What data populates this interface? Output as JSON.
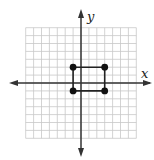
{
  "diagram": {
    "type": "coordinate-plane",
    "axes": {
      "x_label": "x",
      "y_label": "y"
    },
    "grid": {
      "x_min": -7,
      "x_max": 7,
      "y_min": -7,
      "y_max": 7,
      "show": true
    },
    "points": [
      {
        "x": -1,
        "y": 2
      },
      {
        "x": 3,
        "y": 2
      },
      {
        "x": 3,
        "y": -1
      },
      {
        "x": -1,
        "y": -1
      }
    ],
    "shape": "rectangle",
    "colors": {
      "grid": "#c8c8c8",
      "axis": "#333333",
      "point": "#111111"
    }
  }
}
